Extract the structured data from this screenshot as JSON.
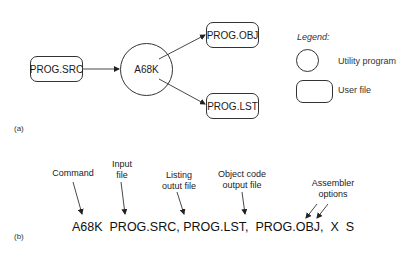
{
  "part_a": {
    "label": "(a)",
    "nodes": {
      "source": "PROG.SRC",
      "program": "A68K",
      "object": "PROG.OBJ",
      "listing": "PROG.LST"
    },
    "legend": {
      "title": "Legend:",
      "utility": "Utility program",
      "user_file": "User file"
    }
  },
  "part_b": {
    "label": "(b)",
    "command_line": "A68K  PROG.SRC, PROG.LST,  PROG.OBJ,  X  S",
    "annotations": {
      "command": "Command",
      "input_1": "Input",
      "input_2": "file",
      "listing_1": "Listing",
      "listing_2": "outut file",
      "object_1": "Object code",
      "object_2": "output file",
      "options_1": "Assembler",
      "options_2": "options"
    }
  }
}
